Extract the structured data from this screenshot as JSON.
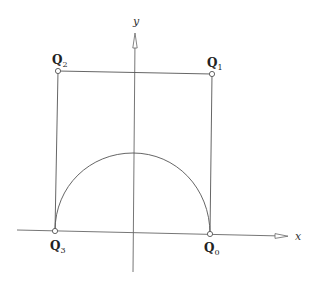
{
  "diagram": {
    "axes": {
      "x_label": "x",
      "y_label": "y"
    },
    "points": [
      {
        "id": "Q0",
        "letter": "Q",
        "subscript": "0",
        "x": 210,
        "y": 234
      },
      {
        "id": "Q1",
        "letter": "Q",
        "subscript": "1",
        "x": 212,
        "y": 74
      },
      {
        "id": "Q2",
        "letter": "Q",
        "subscript": "2",
        "x": 58,
        "y": 71
      },
      {
        "id": "Q3",
        "letter": "Q",
        "subscript": "3",
        "x": 55,
        "y": 231
      }
    ],
    "curve": {
      "type": "semicircular-arc",
      "from": "Q3",
      "to": "Q0",
      "peak": {
        "x": 133,
        "y": 153
      }
    },
    "colors": {
      "stroke": "#555555",
      "background": "#ffffff"
    }
  }
}
